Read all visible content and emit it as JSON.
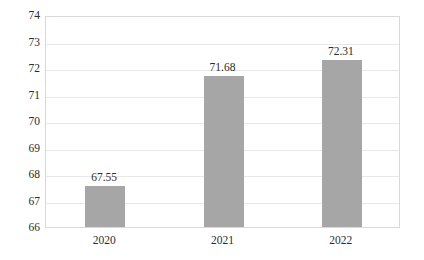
{
  "chart_data": {
    "type": "bar",
    "title": "",
    "subtitle": "",
    "xlabel": "",
    "ylabel": "",
    "categories": [
      "2020",
      "2021",
      "2022"
    ],
    "values": [
      67.55,
      71.68,
      72.31
    ],
    "data_labels": [
      "67.55",
      "71.68",
      "72.31"
    ],
    "ylim": [
      66,
      74
    ],
    "yticks": [
      66,
      67,
      68,
      69,
      70,
      71,
      72,
      73,
      74
    ],
    "ytick_labels": [
      "66",
      "67",
      "68",
      "69",
      "70",
      "71",
      "72",
      "73",
      "74"
    ],
    "grid": "horizontal",
    "legend": "none",
    "series": [
      {
        "name": "",
        "values": [
          67.55,
          71.68,
          72.31
        ]
      }
    ],
    "bar_color": "#a6a6a6",
    "gridline_color": "#e8e8e8",
    "border_color": "#d9d9d9",
    "text_color": "#2b2b2b",
    "background_color": "#ffffff"
  }
}
